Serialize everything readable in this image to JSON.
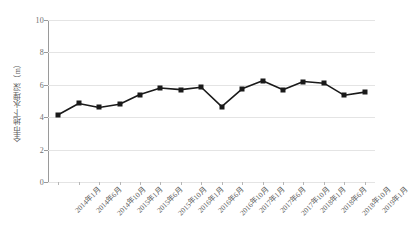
{
  "chart_data": {
    "type": "line",
    "title": "",
    "subtitle": "",
    "xlabel": "",
    "ylabel": "全市地下水埋深（m）",
    "ylim": [
      0,
      10
    ],
    "yticks": [
      0,
      2,
      4,
      6,
      8,
      10
    ],
    "grid": true,
    "legend": false,
    "legend_position": "none",
    "marker": "square",
    "line_color": "#1a1a1a",
    "marker_color": "#1a1a1a",
    "categories": [
      "2014年1月",
      "2014年6月",
      "2014年10月",
      "2015年1月",
      "2015年6月",
      "2015年10月",
      "2016年1月",
      "2016年6月",
      "2016年10月",
      "2017年1月",
      "2017年6月",
      "2017年10月",
      "2018年1月",
      "2018年6月",
      "2018年10月",
      "2019年1月"
    ],
    "values": [
      4.15,
      4.85,
      4.6,
      4.8,
      5.4,
      5.8,
      5.7,
      5.85,
      4.65,
      5.75,
      6.25,
      5.7,
      6.2,
      6.1,
      5.35,
      5.55
    ]
  },
  "axis": {
    "y_title": "全市地下水埋深（m）",
    "y_tick_labels": [
      "10",
      "8",
      "6",
      "4",
      "2",
      "0"
    ]
  }
}
